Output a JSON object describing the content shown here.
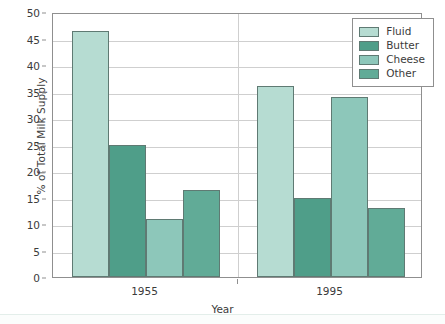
{
  "chart_data": {
    "type": "bar",
    "title": "",
    "xlabel": "Year",
    "ylabel": "% of Total Milk Supply",
    "categories": [
      "1955",
      "1995"
    ],
    "series": [
      {
        "name": "Fluid",
        "color": "#b6dcd2",
        "values": [
          46.5,
          36
        ]
      },
      {
        "name": "Butter",
        "color": "#4f9e89",
        "values": [
          25,
          15
        ]
      },
      {
        "name": "Cheese",
        "color": "#8dc7ba",
        "values": [
          11,
          34
        ]
      },
      {
        "name": "Other",
        "color": "#61ab97",
        "values": [
          16.5,
          13
        ]
      }
    ],
    "ylim": [
      0,
      50
    ],
    "y_ticks": [
      0,
      5,
      10,
      15,
      20,
      25,
      30,
      35,
      40,
      45,
      50
    ],
    "y_tick_labels": [
      "0",
      "5",
      "10",
      "15",
      "20",
      "25",
      "30",
      "35",
      "40",
      "45",
      "50"
    ],
    "grid": true,
    "legend_position": "top-right",
    "legend_entries": [
      "Fluid",
      "Butter",
      "Cheese",
      "Other"
    ]
  },
  "axes": {
    "y_title": "% of Total Milk Supply",
    "x_title": "Year",
    "x_group_labels": [
      "1955",
      "1995"
    ]
  },
  "legend": {
    "items": [
      {
        "label": "Fluid",
        "color": "#b6dcd2"
      },
      {
        "label": "Butter",
        "color": "#4f9e89"
      },
      {
        "label": "Cheese",
        "color": "#8dc7ba"
      },
      {
        "label": "Other",
        "color": "#61ab97"
      }
    ]
  },
  "style": {
    "frame_color": "#8f8f8f",
    "grid_color": "#cfcfcf",
    "bar_edge_color": "#5f7a73",
    "text_color": "#3b3b3b",
    "background": "#ffffff"
  }
}
